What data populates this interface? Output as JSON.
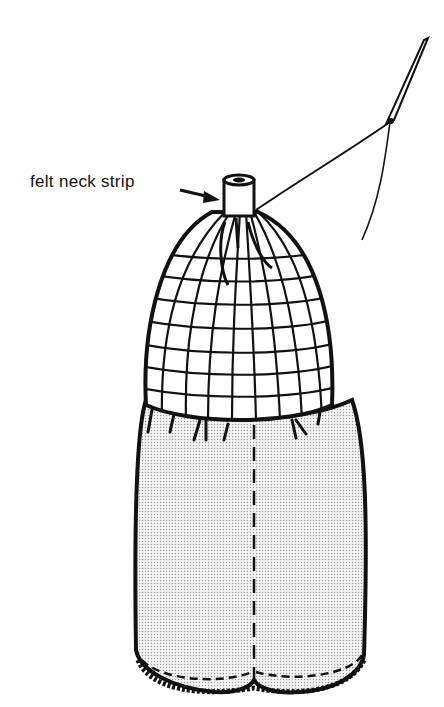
{
  "figure": {
    "type": "line illustration",
    "labels": [
      {
        "text": "felt neck strip",
        "points_to": "neck cylinder at top of head"
      }
    ],
    "elements": [
      "felt neck strip",
      "gridded head (dome)",
      "needle and thread",
      "stippled body with center seam",
      "lace hem"
    ],
    "colors": {
      "ink": "#111111",
      "fill": "#ffffff",
      "stipple": "#d8d8d8"
    }
  }
}
